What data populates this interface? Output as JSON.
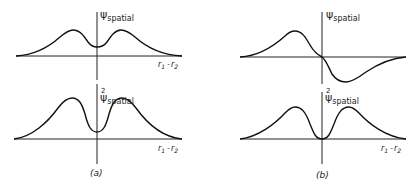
{
  "panels": [
    {
      "id": "a",
      "caption": "(a)",
      "top": {
        "ylabel_symbol": "ψ",
        "ylabel_sub": "spatial",
        "ylabel_sup": "",
        "xlabel_r1": "r",
        "xlabel_sub1": "1",
        "xlabel_dash": "-",
        "xlabel_r2": "r",
        "xlabel_sub2": "2"
      },
      "bottom": {
        "ylabel_symbol": "ψ",
        "ylabel_sub": "spatial",
        "ylabel_sup": "2",
        "xlabel_r1": "r",
        "xlabel_sub1": "1",
        "xlabel_dash": "-",
        "xlabel_r2": "r",
        "xlabel_sub2": "2"
      }
    },
    {
      "id": "b",
      "caption": "(b)",
      "top": {
        "ylabel_symbol": "ψ",
        "ylabel_sub": "spatial",
        "ylabel_sup": ""
      },
      "bottom": {
        "ylabel_symbol": "ψ",
        "ylabel_sub": "spatial",
        "ylabel_sup": "2",
        "xlabel_r1": "r",
        "xlabel_sub1": "1",
        "xlabel_dash": "-",
        "xlabel_r2": "r",
        "xlabel_sub2": "2"
      }
    }
  ],
  "descriptions": {
    "a_top": "Symmetric spatial wavefunction: two peaks with nonzero dip at r1-r2 = 0",
    "a_bottom": "Squared symmetric wavefunction: two peaks with nonzero minimum at origin",
    "b_top": "Antisymmetric spatial wavefunction: positive peak left, negative trough right, zero at origin",
    "b_bottom": "Squared antisymmetric wavefunction: two peaks, zero at origin"
  }
}
